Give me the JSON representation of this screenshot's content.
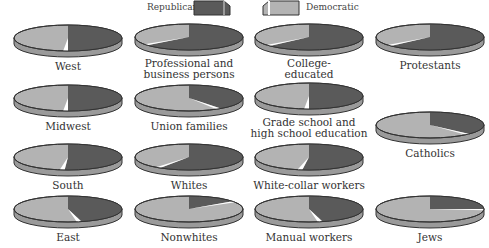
{
  "colors": {
    "republican": "#5a5a5a",
    "democratic": "#b3b3b3",
    "side": "#9a9a9a",
    "outline": "#333333",
    "gap": "#ffffff"
  },
  "legend": {
    "republican_label": "Republican",
    "democratic_label": "Democratic"
  },
  "chart_data": {
    "type": "pie",
    "title": "",
    "legend": [
      "Republican",
      "Democratic"
    ],
    "legend_position": "top",
    "note": "Republican share estimated from slice angle (dark slice, clockwise from 12 o'clock); Democratic share is the remainder.",
    "pies": [
      {
        "label": "West",
        "republican": 50,
        "democratic": 50
      },
      {
        "label": "Midwest",
        "republican": 50,
        "democratic": 50
      },
      {
        "label": "South",
        "republican": 51,
        "democratic": 49
      },
      {
        "label": "East",
        "republican": 46,
        "democratic": 54
      },
      {
        "label": "Professional and business persons",
        "republican": 64,
        "democratic": 36
      },
      {
        "label": "Union families",
        "republican": 40,
        "democratic": 60
      },
      {
        "label": "Whites",
        "republican": 59,
        "democratic": 41
      },
      {
        "label": "Nonwhites",
        "republican": 15,
        "democratic": 85
      },
      {
        "label": "College-educated",
        "republican": 63,
        "democratic": 37
      },
      {
        "label": "Grade school and high school education",
        "republican": 50,
        "democratic": 50
      },
      {
        "label": "White-collar workers",
        "republican": 52,
        "democratic": 48
      },
      {
        "label": "Manual workers",
        "republican": 46,
        "democratic": 54
      },
      {
        "label": "Protestants",
        "republican": 63,
        "democratic": 37
      },
      {
        "label": "Catholics",
        "republican": 37,
        "democratic": 63
      },
      {
        "label": "Jews",
        "republican": 25,
        "democratic": 75
      }
    ]
  },
  "pies": [
    {
      "id": "west",
      "line1": "West",
      "line2": "",
      "cx": 68,
      "cy": 38,
      "lx": 68,
      "ly": 61
    },
    {
      "id": "midwest",
      "line1": "Midwest",
      "line2": "",
      "cx": 68,
      "cy": 98,
      "lx": 68,
      "ly": 121
    },
    {
      "id": "south",
      "line1": "South",
      "line2": "",
      "cx": 68,
      "cy": 157,
      "lx": 68,
      "ly": 180
    },
    {
      "id": "east",
      "line1": "East",
      "line2": "",
      "cx": 68,
      "cy": 209,
      "lx": 68,
      "ly": 232
    },
    {
      "id": "professional",
      "line1": "Professional and",
      "line2": "business persons",
      "cx": 189,
      "cy": 37,
      "lx": 189,
      "ly": 58
    },
    {
      "id": "union",
      "line1": "Union families",
      "line2": "",
      "cx": 189,
      "cy": 98,
      "lx": 189,
      "ly": 121
    },
    {
      "id": "whites",
      "line1": "Whites",
      "line2": "",
      "cx": 189,
      "cy": 157,
      "lx": 189,
      "ly": 180
    },
    {
      "id": "nonwhites",
      "line1": "Nonwhites",
      "line2": "",
      "cx": 189,
      "cy": 209,
      "lx": 189,
      "ly": 232
    },
    {
      "id": "college",
      "line1": "College-",
      "line2": "educated",
      "cx": 309,
      "cy": 37,
      "lx": 309,
      "ly": 58
    },
    {
      "id": "gradeschool",
      "line1": "Grade school and",
      "line2": "high school education",
      "cx": 309,
      "cy": 96,
      "lx": 309,
      "ly": 117
    },
    {
      "id": "whitecollar",
      "line1": "White-collar workers",
      "line2": "",
      "cx": 309,
      "cy": 157,
      "lx": 309,
      "ly": 180
    },
    {
      "id": "manual",
      "line1": "Manual workers",
      "line2": "",
      "cx": 309,
      "cy": 209,
      "lx": 309,
      "ly": 232
    },
    {
      "id": "protestants",
      "line1": "Protestants",
      "line2": "",
      "cx": 430,
      "cy": 37,
      "lx": 430,
      "ly": 60
    },
    {
      "id": "catholics",
      "line1": "Catholics",
      "line2": "",
      "cx": 430,
      "cy": 125,
      "lx": 430,
      "ly": 148
    },
    {
      "id": "jews",
      "line1": "Jews",
      "line2": "",
      "cx": 430,
      "cy": 209,
      "lx": 430,
      "ly": 232
    }
  ]
}
